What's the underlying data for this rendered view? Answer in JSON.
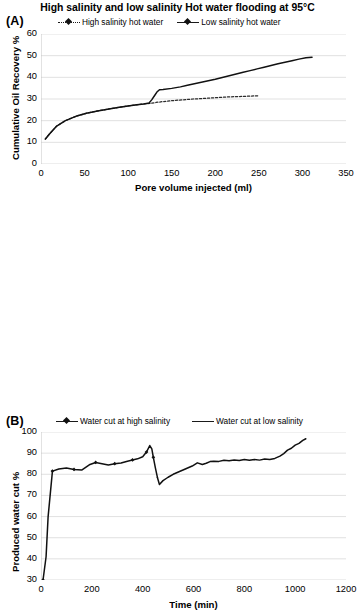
{
  "figure": {
    "panel_a_label": "(A)",
    "panel_b_label": "(B)"
  },
  "panel_a": {
    "title": "High salinity and low salinity Hot water flooding at 95°C",
    "legend": [
      {
        "label": "High salinity hot water",
        "marker": "dashed-line-with-diamond",
        "color": "#1a1a1a"
      },
      {
        "label": "Low salinity hot water",
        "marker": "solid-line-with-diamond",
        "color": "#111111"
      }
    ]
  },
  "panel_b": {
    "legend": [
      {
        "label": "Water cut at high salinity",
        "marker": "solid-line-with-diamond",
        "color": "#111111"
      },
      {
        "label": "Water cut at low salinity",
        "marker": "solid-line",
        "color": "#333333"
      }
    ]
  },
  "chart_data": [
    {
      "type": "line",
      "panel": "A",
      "title": "High salinity and low salinity Hot water flooding at 95°C",
      "xlabel": "Pore volume injected (ml)",
      "ylabel": "Cumulative Oil Recovery %",
      "xlim": [
        0,
        350
      ],
      "ylim": [
        0,
        60
      ],
      "xticks": [
        0,
        50,
        100,
        150,
        200,
        250,
        300,
        350
      ],
      "yticks": [
        0,
        10,
        20,
        30,
        40,
        50,
        60
      ],
      "grid": "horizontal",
      "legend_position": "top",
      "series": [
        {
          "name": "High salinity hot water",
          "style": "dashed",
          "x": [
            5,
            10,
            18,
            28,
            40,
            52,
            65,
            78,
            90,
            100,
            110,
            118,
            125,
            132,
            140,
            150,
            162,
            175,
            188,
            200,
            212,
            225,
            238,
            250
          ],
          "y": [
            11.5,
            14.0,
            17.5,
            20.0,
            22.0,
            23.4,
            24.5,
            25.4,
            26.2,
            26.8,
            27.3,
            27.7,
            28.0,
            28.4,
            28.8,
            29.2,
            29.6,
            30.0,
            30.3,
            30.6,
            30.9,
            31.1,
            31.3,
            31.5
          ]
        },
        {
          "name": "Low salinity hot water",
          "style": "solid",
          "x": [
            5,
            10,
            18,
            28,
            40,
            52,
            65,
            78,
            90,
            100,
            110,
            118,
            124,
            127,
            130,
            133,
            136,
            140,
            150,
            160,
            168,
            176,
            184,
            192,
            200,
            208,
            216,
            224,
            232,
            240,
            248,
            256,
            264,
            272,
            280,
            288,
            296,
            304,
            311
          ],
          "y": [
            11.5,
            14.0,
            17.5,
            20.0,
            22.0,
            23.4,
            24.5,
            25.4,
            26.2,
            26.8,
            27.3,
            27.7,
            28.2,
            29.6,
            31.4,
            33.2,
            34.3,
            34.4,
            34.9,
            35.6,
            36.3,
            37.0,
            37.7,
            38.4,
            39.1,
            39.9,
            40.7,
            41.5,
            42.3,
            43.1,
            43.9,
            44.7,
            45.5,
            46.3,
            47.0,
            47.7,
            48.4,
            49.0,
            49.3
          ]
        }
      ]
    },
    {
      "type": "line",
      "panel": "B",
      "title": "",
      "xlabel": "Time (min)",
      "ylabel": "Produced water cut %",
      "xlim": [
        0,
        1200
      ],
      "ylim": [
        30,
        100
      ],
      "xticks": [
        0,
        200,
        400,
        600,
        800,
        1000,
        1200
      ],
      "yticks": [
        30,
        40,
        50,
        60,
        70,
        80,
        90,
        100
      ],
      "grid": "horizontal",
      "legend_position": "top",
      "series": [
        {
          "name": "Water cut at high salinity",
          "style": "solid",
          "x": [
            8,
            20,
            28,
            45,
            70,
            100,
            130,
            160,
            190,
            215,
            240,
            265,
            290,
            315,
            340,
            360,
            380,
            400,
            415,
            428,
            436,
            442,
            450,
            458
          ],
          "y": [
            30.0,
            41.0,
            60.0,
            81.5,
            82.5,
            83.0,
            82.3,
            82.0,
            84.5,
            85.6,
            85.0,
            84.4,
            85.0,
            85.3,
            86.2,
            86.8,
            87.3,
            88.3,
            90.5,
            93.6,
            92.0,
            88.0,
            83.0,
            78.5
          ]
        },
        {
          "name": "Water cut at low salinity",
          "style": "solid",
          "x": [
            458,
            466,
            480,
            500,
            520,
            545,
            570,
            595,
            615,
            635,
            650,
            665,
            680,
            700,
            720,
            740,
            760,
            780,
            800,
            820,
            840,
            860,
            880,
            900,
            920,
            940,
            955,
            970,
            985,
            1000,
            1015,
            1030,
            1042
          ],
          "y": [
            78.5,
            75.2,
            77.0,
            78.6,
            80.0,
            81.3,
            82.6,
            83.9,
            85.4,
            84.6,
            85.2,
            86.0,
            86.2,
            86.1,
            86.6,
            86.4,
            86.8,
            86.5,
            87.0,
            86.6,
            87.0,
            86.7,
            87.2,
            87.0,
            87.5,
            88.6,
            89.8,
            91.4,
            92.3,
            93.8,
            94.6,
            96.0,
            96.8
          ]
        }
      ]
    }
  ]
}
